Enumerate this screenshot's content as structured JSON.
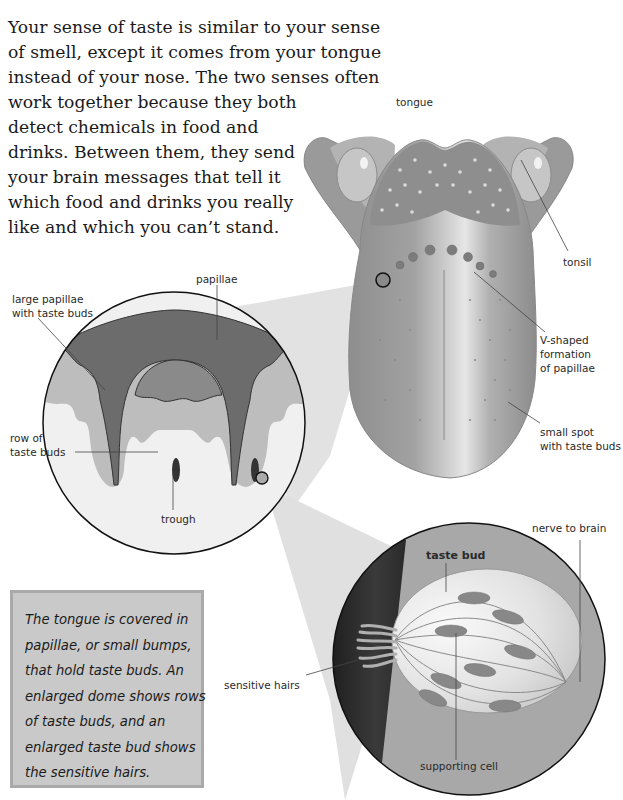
{
  "intro": {
    "lines": [
      "Your sense of taste is similar to your sense",
      "of smell, except it comes from your tongue",
      "instead of your nose. The two senses often",
      "work together because they both",
      "detect chemicals in food and",
      "drinks. Between them, they send",
      "your brain messages that tell it",
      "which food and drinks you really",
      "like and which you can’t stand."
    ]
  },
  "labels": {
    "tongue": "tongue",
    "tonsil": "tonsil",
    "v_shaped_1": "V-shaped",
    "v_shaped_2": "formation",
    "v_shaped_3": "of papillae",
    "small_spot_1": "small spot",
    "small_spot_2": "with taste buds",
    "papillae": "papillae",
    "large_papillae_1": "large papillae",
    "large_papillae_2": "with taste buds",
    "row_of_1": "row of",
    "row_of_2": "taste buds",
    "trough": "trough",
    "nerve_to_brain": "nerve to brain",
    "taste_bud": "taste bud",
    "sensitive_hairs": "sensitive hairs",
    "supporting_cell": "supporting cell"
  },
  "caption": {
    "lines": [
      "The tongue is covered in",
      "papillae, or small bumps,",
      "that hold taste buds. An",
      "enlarged dome shows rows",
      "of taste buds, and an",
      "enlarged taste bud shows",
      "the sensitive hairs."
    ]
  },
  "colors": {
    "tongue_body": "#9e9e9e",
    "tongue_dark": "#7e7e7e",
    "tonsil": "#c4c4c4",
    "zoom_cone": "#dcdcdc",
    "papillae_dark": "#6a6a6a",
    "caption_bg": "#c9c9c9",
    "tissue_dark": "#2e2e2e"
  }
}
